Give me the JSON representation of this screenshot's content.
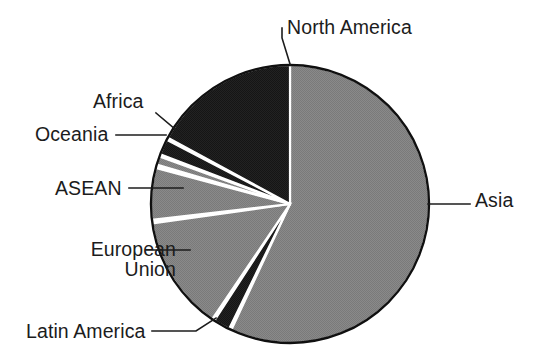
{
  "chart_data": {
    "type": "pie",
    "title": "",
    "subtitle": "",
    "xlabel": "",
    "ylabel": "",
    "legend_position": "callout-labels",
    "grid": false,
    "center": {
      "x": 290,
      "y": 204
    },
    "radius": 139,
    "start_angle_deg": 0,
    "direction": "clockwise",
    "categories": [
      "Asia",
      "Latin America",
      "European Union",
      "ASEAN",
      "Oceania",
      "Africa",
      "North America"
    ],
    "values": [
      57.0,
      2.0,
      13.5,
      6.0,
      1.0,
      2.0,
      18.5
    ],
    "slices": [
      {
        "label": "Asia",
        "value": 57.0,
        "start_deg": 0.0,
        "end_deg": 205.0,
        "color": "#858585"
      },
      {
        "label": "Latin America",
        "value": 2.0,
        "start_deg": 206.0,
        "end_deg": 213.0,
        "color": "#1e1e1e"
      },
      {
        "label": "European Union",
        "value": 13.5,
        "start_deg": 214.0,
        "end_deg": 262.0,
        "color": "#858585"
      },
      {
        "label": "ASEAN",
        "value": 6.0,
        "start_deg": 263.5,
        "end_deg": 285.0,
        "color": "#858585"
      },
      {
        "label": "Oceania",
        "value": 1.0,
        "start_deg": 286.5,
        "end_deg": 290.0,
        "color": "#858585"
      },
      {
        "label": "Africa",
        "value": 2.0,
        "start_deg": 291.0,
        "end_deg": 297.5,
        "color": "#1e1e1e"
      },
      {
        "label": "North America",
        "value": 18.5,
        "start_deg": 298.5,
        "end_deg": 360.0,
        "color": "#1e1e1e"
      }
    ],
    "colors": {
      "light_gray": "#858585",
      "dark": "#1e1e1e",
      "outline": "#101010",
      "separator": "#ffffff",
      "background": "#ffffff",
      "text": "#1c1c1c"
    }
  },
  "labels": {
    "north_america": "North America",
    "asia": "Asia",
    "africa": "Africa",
    "oceania": "Oceania",
    "asean": "ASEAN",
    "european_union_line1": "European",
    "european_union_line2": "Union",
    "latin_america": "Latin America"
  }
}
